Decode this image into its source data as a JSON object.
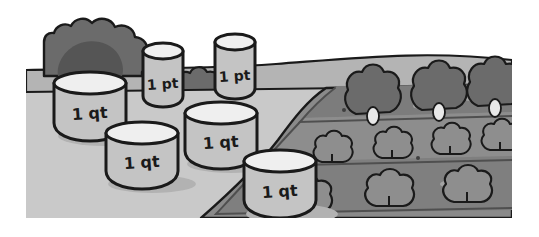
{
  "scene": {
    "title": "Garden with measuring containers",
    "background_color": "#ffffff",
    "ground_color": "#c9c9c9",
    "ground_far_color": "#b4b4b4",
    "soil_color": "#8a8a8a",
    "soil_dark_color": "#6e6e6e",
    "bush_color": "#6b6b6b",
    "bush_shadow_color": "#525252",
    "container_body_color": "#c4c4c4",
    "container_top_color": "#efefef",
    "outline_color": "#1a1a1a",
    "shadow_color": "#b0b0b0"
  },
  "containers": [
    {
      "id": "quart-1",
      "label": "1 qt",
      "unit": "qt",
      "quantity": 1,
      "x": 28,
      "y": 66,
      "width": 72,
      "height": 62,
      "ellipse_ry": 11,
      "label_x": 64,
      "label_y": 108
    },
    {
      "id": "pint-1",
      "label": "1 pt",
      "unit": "pt",
      "quantity": 1,
      "x": 117,
      "y": 37,
      "width": 40,
      "height": 60,
      "ellipse_ry": 8,
      "label_x": 137,
      "label_y": 78
    },
    {
      "id": "pint-2",
      "label": "1 pt",
      "unit": "pt",
      "quantity": 1,
      "x": 189,
      "y": 28,
      "width": 40,
      "height": 62,
      "ellipse_ry": 8,
      "label_x": 209,
      "label_y": 70
    },
    {
      "id": "quart-2",
      "label": "1 qt",
      "unit": "qt",
      "quantity": 1,
      "x": 159,
      "y": 96,
      "width": 72,
      "height": 60,
      "ellipse_ry": 11,
      "label_x": 195,
      "label_y": 136
    },
    {
      "id": "quart-3",
      "label": "1 qt",
      "unit": "qt",
      "quantity": 1,
      "x": 80,
      "y": 116,
      "width": 72,
      "height": 60,
      "ellipse_ry": 11,
      "label_x": 116,
      "label_y": 156
    },
    {
      "id": "quart-4",
      "label": "1 qt",
      "unit": "qt",
      "quantity": 1,
      "x": 218,
      "y": 144,
      "width": 72,
      "height": 62,
      "ellipse_ry": 11,
      "label_x": 254,
      "label_y": 186
    }
  ],
  "counts": {
    "quart_containers": 4,
    "pint_containers": 2
  },
  "garden": {
    "rows": 4,
    "plants_back_row": 3,
    "plants_middle_row": 4,
    "plants_front_row": 3
  }
}
